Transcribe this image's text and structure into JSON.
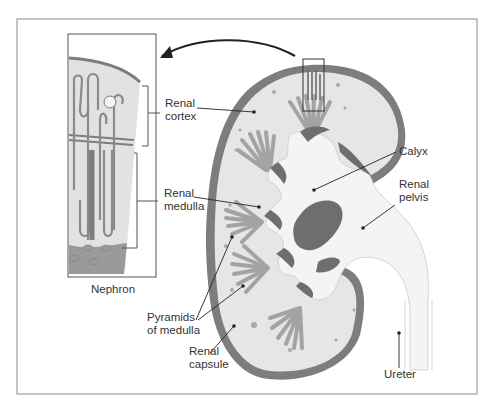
{
  "figure": {
    "inset_caption": "Nephron",
    "labels": {
      "renal_cortex": [
        "Renal",
        "cortex"
      ],
      "renal_medulla": [
        "Renal",
        "medulla"
      ],
      "pyramids": [
        "Pyramids",
        "of medulla"
      ],
      "renal_capsule": [
        "Renal",
        "capsule"
      ],
      "calyx": [
        "Calyx"
      ],
      "renal_pelvis": [
        "Renal",
        "pelvis"
      ],
      "ureter": [
        "Ureter"
      ]
    },
    "colors": {
      "frame": "#8a8a8a",
      "capsule": "#7d7d7d",
      "tissue": "#e6e6e6",
      "pyramid": "#9a9a9a",
      "pelvis": "#f4f4f4",
      "dark_fill": "#6e6e6e",
      "leader": "#222222"
    }
  }
}
